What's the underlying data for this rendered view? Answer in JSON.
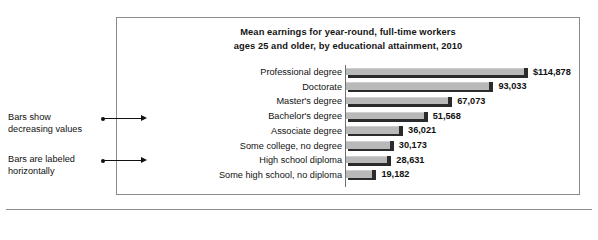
{
  "figure": {
    "frame_color": "#8b8b8b",
    "background": "#ffffff"
  },
  "annotations": [
    {
      "name": "bars-show-decreasing-values",
      "line1": "Bars show",
      "line2": "decreasing values"
    },
    {
      "name": "bars-are-labeled-horizontally",
      "line1": "Bars are labeled",
      "line2": "horizontally"
    }
  ],
  "chart_data": {
    "type": "bar",
    "orientation": "horizontal",
    "title": "Mean earnings for year-round, full-time workers ages 25 and older, by educational attainment, 2010",
    "title_line1": "Mean earnings for year-round, full-time workers",
    "title_line2": "ages 25 and older, by educational attainment, 2010",
    "xlabel": "",
    "ylabel": "",
    "grid": false,
    "legend": false,
    "bar_color": "#b9b9b9",
    "bar_shadow_color": "#2b2b2b",
    "xlim": [
      0,
      114878
    ],
    "categories": [
      "Professional degree",
      "Doctorate",
      "Master's degree",
      "Bachelor's degree",
      "Associate degree",
      "Some college, no degree",
      "High school diploma",
      "Some high school, no diploma"
    ],
    "values": [
      114878,
      93033,
      67073,
      51568,
      36021,
      30173,
      28631,
      19182
    ],
    "value_labels": [
      "$114,878",
      "93,033",
      "67,073",
      "51,568",
      "36,021",
      "30,173",
      "28,631",
      "19,182"
    ]
  }
}
